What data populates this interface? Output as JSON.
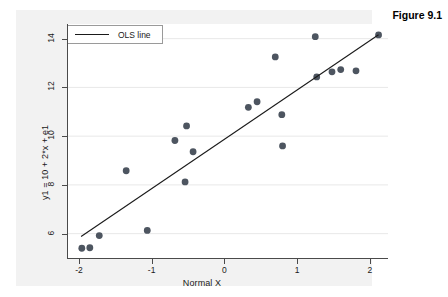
{
  "figure": {
    "caption": "Figure 9.1"
  },
  "legend": {
    "items": [
      {
        "label": "OLS line",
        "marker": "line",
        "color": "#1a1a1a"
      }
    ]
  },
  "chart_data": {
    "type": "scatter",
    "title": "",
    "xlabel": "Normal X",
    "ylabel": "y1 = 10 + 2*x + e1",
    "xlim": [
      -2.15,
      2.25
    ],
    "ylim": [
      5.0,
      14.6
    ],
    "xticks": [
      -2,
      -1,
      0,
      1,
      2
    ],
    "yticks": [
      6,
      8,
      10,
      12,
      14
    ],
    "xtick_labels": [
      "-2",
      "-1",
      "0",
      "1",
      "2"
    ],
    "ytick_labels": [
      "6",
      "8",
      "10",
      "12",
      "14"
    ],
    "grid": "horizontal",
    "grid_color": "#e8e8e8",
    "legend_position": "top-left",
    "marker_color": "#4d5560",
    "marker_size": 3.4,
    "series": [
      {
        "name": "y1 = 10 + 2*x + e1",
        "type": "scatter",
        "points": [
          {
            "x": -1.96,
            "y": 5.4
          },
          {
            "x": -1.85,
            "y": 5.42
          },
          {
            "x": -1.72,
            "y": 5.92
          },
          {
            "x": -1.35,
            "y": 8.58
          },
          {
            "x": -1.06,
            "y": 6.13
          },
          {
            "x": -0.68,
            "y": 9.82
          },
          {
            "x": -0.54,
            "y": 8.12
          },
          {
            "x": -0.52,
            "y": 10.42
          },
          {
            "x": -0.43,
            "y": 9.36
          },
          {
            "x": 0.33,
            "y": 11.18
          },
          {
            "x": 0.45,
            "y": 11.41
          },
          {
            "x": 0.7,
            "y": 13.25
          },
          {
            "x": 0.79,
            "y": 10.88
          },
          {
            "x": 0.8,
            "y": 9.6
          },
          {
            "x": 1.25,
            "y": 14.08
          },
          {
            "x": 1.27,
            "y": 12.43
          },
          {
            "x": 1.48,
            "y": 12.64
          },
          {
            "x": 1.6,
            "y": 12.73
          },
          {
            "x": 1.81,
            "y": 12.68
          },
          {
            "x": 2.12,
            "y": 14.15
          }
        ]
      },
      {
        "name": "OLS line",
        "type": "line",
        "color": "#1a1a1a",
        "endpoints": [
          {
            "x": -1.97,
            "y": 5.88
          },
          {
            "x": 2.12,
            "y": 14.16
          }
        ]
      }
    ]
  }
}
